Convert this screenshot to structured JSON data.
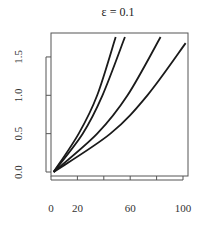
{
  "chart_data": {
    "type": "line",
    "title": "ε = 0.1",
    "xlabel": "",
    "ylabel": "",
    "xlim": [
      0,
      103
    ],
    "ylim": [
      0,
      1.8
    ],
    "x_ticks": [
      0,
      20,
      40,
      60,
      80,
      100
    ],
    "x_tick_labels": [
      "0",
      "20",
      "",
      "60",
      "",
      "100"
    ],
    "y_ticks": [
      0.0,
      0.5,
      1.0,
      1.5
    ],
    "y_tick_labels": [
      "0.0",
      "0.5",
      "1.0",
      "1.5"
    ],
    "grid": false,
    "legend": null,
    "series": [
      {
        "name": "curve-1",
        "x": [
          2,
          21,
          35,
          49
        ],
        "y": [
          0.0,
          0.5,
          1.0,
          1.76
        ]
      },
      {
        "name": "curve-2",
        "x": [
          2,
          24,
          39,
          56
        ],
        "y": [
          0.0,
          0.5,
          1.0,
          1.76
        ]
      },
      {
        "name": "curve-3",
        "x": [
          2,
          35,
          58,
          83
        ],
        "y": [
          0.0,
          0.5,
          1.0,
          1.76
        ]
      },
      {
        "name": "curve-4",
        "x": [
          2,
          45,
          73,
          102
        ],
        "y": [
          0.0,
          0.5,
          1.0,
          1.68
        ]
      }
    ],
    "line_color": "#1a1a1a"
  }
}
